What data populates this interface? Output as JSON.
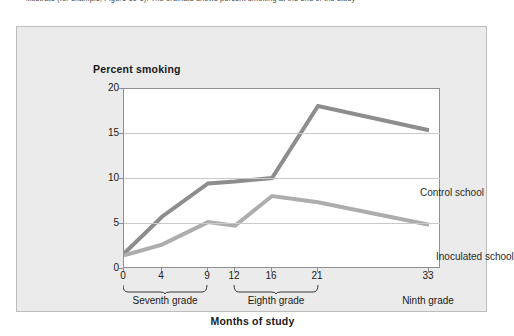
{
  "caption": "illustrate (for example, Figure 10-1). The ordinate shows percent smoking at the end of the study",
  "chart_data": {
    "type": "line",
    "title": "",
    "xlabel": "Months of study",
    "ylabel": "Percent smoking",
    "xlim": [
      0,
      36
    ],
    "ylim": [
      0,
      20
    ],
    "grid": true,
    "legend_position": "inline-annotation",
    "x_ticks": [
      0,
      4,
      9,
      12,
      16,
      21,
      33
    ],
    "x_tick_labels": [
      "0",
      "4",
      "9",
      "12",
      "16",
      "21",
      "33"
    ],
    "y_ticks": [
      0,
      5,
      10,
      15,
      20
    ],
    "y_tick_labels": [
      "0",
      "5",
      "10",
      "15",
      "20"
    ],
    "x_groups": [
      {
        "label": "Seventh grade",
        "from": 0,
        "to": 9
      },
      {
        "label": "Eighth grade",
        "from": 12,
        "to": 21
      },
      {
        "label": "Ninth grade",
        "from": 33,
        "to": 33
      }
    ],
    "series": [
      {
        "name": "Control school",
        "color": "#8d8d8d",
        "x": [
          0,
          4,
          9,
          12,
          16,
          21,
          33
        ],
        "values": [
          1.6,
          5.7,
          9.4,
          9.6,
          10.0,
          18.0,
          15.3
        ]
      },
      {
        "name": "Inoculated school",
        "color": "#adadad",
        "x": [
          0,
          4,
          9,
          12,
          16,
          21,
          33
        ],
        "values": [
          1.4,
          2.6,
          5.1,
          4.7,
          8.0,
          7.3,
          4.8
        ]
      }
    ],
    "annotations": [
      {
        "text": "Control school",
        "x": 21,
        "y": 15.0
      },
      {
        "text": "Inoculated school",
        "x": 24,
        "y": 8.4
      }
    ]
  },
  "colors": {
    "panel_background": "#ebebeb",
    "panel_border": "#bdbdbd",
    "plot_background": "#ffffff",
    "axis": "#8f8f8f",
    "gridline": "#c9c9c9",
    "control_line": "#8d8d8d",
    "inoculated_line": "#adadad",
    "text": "#1a1a1a"
  }
}
